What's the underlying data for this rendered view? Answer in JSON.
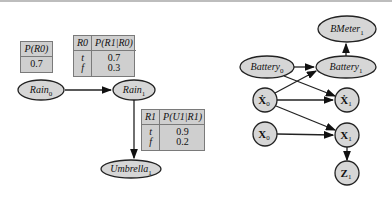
{
  "left_diagram": {
    "prior_table": {
      "header": "P(R0)",
      "value": "0.7"
    },
    "transition_table": {
      "headers": [
        "R0",
        "P(R1|R0)"
      ],
      "rows": [
        {
          "cond": "t",
          "prob": "0.7"
        },
        {
          "cond": "f",
          "prob": "0.3"
        }
      ]
    },
    "sensor_table": {
      "headers": [
        "R1",
        "P(U1|R1)"
      ],
      "rows": [
        {
          "cond": "t",
          "prob": "0.9"
        },
        {
          "cond": "f",
          "prob": "0.2"
        }
      ]
    },
    "nodes": {
      "rain0": {
        "base": "Rain",
        "sub": "0"
      },
      "rain1": {
        "base": "Rain",
        "sub": "1"
      },
      "umbrella1": {
        "base": "Umbrella",
        "sub": "1"
      }
    },
    "edges": [
      [
        "Rain0",
        "Rain1"
      ],
      [
        "Rain1",
        "Umbrella1"
      ]
    ]
  },
  "right_diagram": {
    "nodes": {
      "bmeter1": {
        "base": "BMeter",
        "sub": "1"
      },
      "battery0": {
        "base": "Battery",
        "sub": "0"
      },
      "battery1": {
        "base": "Battery",
        "sub": "1"
      },
      "xdot0": {
        "base": "Ẋ",
        "sub": "0"
      },
      "xdot1": {
        "base": "Ẋ",
        "sub": "1"
      },
      "x0": {
        "base": "X",
        "sub": "0"
      },
      "x1": {
        "base": "X",
        "sub": "1"
      },
      "z1": {
        "base": "Z",
        "sub": "1"
      }
    },
    "edges": [
      [
        "Battery0",
        "Battery1"
      ],
      [
        "Battery0",
        "Xdot1"
      ],
      [
        "Xdot0",
        "Battery1"
      ],
      [
        "Xdot0",
        "Xdot1"
      ],
      [
        "Xdot0",
        "X1"
      ],
      [
        "X0",
        "X1"
      ],
      [
        "X1",
        "Z1"
      ],
      [
        "Battery1",
        "BMeter1"
      ]
    ]
  },
  "colors": {
    "node_fill": "#d6d6d6",
    "table_fill": "#cfcfcf",
    "stroke": "#222222"
  }
}
